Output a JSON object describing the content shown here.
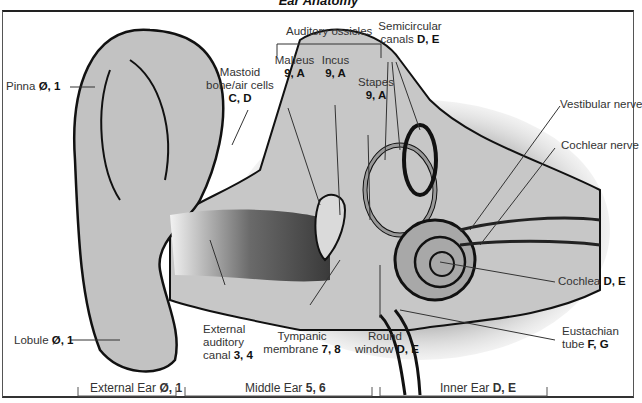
{
  "title": "Ear Anatomy",
  "labels": {
    "pinna": {
      "name": "Pinna",
      "code": "Ø, 1"
    },
    "mastoid": {
      "line1": "Mastoid",
      "line2": "bone/air cells",
      "code": "C, D"
    },
    "auditory_ossicles": {
      "name": "Auditory ossicles"
    },
    "malleus": {
      "name": "Malleus",
      "code": "9, A"
    },
    "incus": {
      "name": "Incus",
      "code": "9, A"
    },
    "stapes": {
      "name": "Stapes",
      "code": "9, A"
    },
    "semicircular": {
      "line1": "Semicircular",
      "line2": "canals",
      "code": "D, E"
    },
    "vestibular_nerve": {
      "name": "Vestibular nerve"
    },
    "cochlear_nerve": {
      "name": "Cochlear nerve"
    },
    "cochlea": {
      "name": "Cochlea",
      "code": "D, E"
    },
    "eustachian": {
      "line1": "Eustachian",
      "line2": "tube",
      "code": "F, G"
    },
    "round_window": {
      "line1": "Round",
      "line2": "window",
      "code": "D, E"
    },
    "tympanic": {
      "line1": "Tympanic",
      "line2": "membrane",
      "code": "7, 8"
    },
    "external_canal": {
      "line1": "External",
      "line2": "auditory",
      "line3": "canal",
      "code": "3, 4"
    },
    "lobule": {
      "name": "Lobule",
      "code": "Ø, 1"
    }
  },
  "sections": [
    {
      "name": "External Ear",
      "code": "Ø, 1"
    },
    {
      "name": "Middle Ear",
      "code": "5, 6"
    },
    {
      "name": "Inner Ear",
      "code": "D, E"
    }
  ]
}
